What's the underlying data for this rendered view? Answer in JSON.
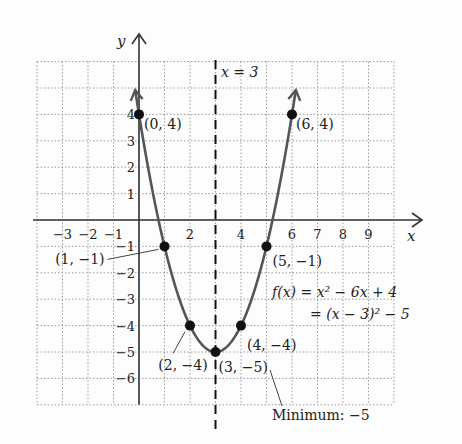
{
  "chart_data": {
    "type": "line",
    "title": "",
    "xlabel": "x",
    "ylabel": "y",
    "xlim": [
      -4,
      10
    ],
    "ylim": [
      -7,
      6
    ],
    "grid": true,
    "x_tick_labels": [
      {
        "x": -3,
        "label": "−3"
      },
      {
        "x": -2,
        "label": "−2"
      },
      {
        "x": -1,
        "label": "−1"
      },
      {
        "x": 2,
        "label": "2"
      },
      {
        "x": 4,
        "label": "4"
      },
      {
        "x": 6,
        "label": "6"
      },
      {
        "x": 7,
        "label": "7"
      },
      {
        "x": 8,
        "label": "8"
      },
      {
        "x": 9,
        "label": "9"
      }
    ],
    "y_tick_labels": [
      {
        "y": 4,
        "label": "4"
      },
      {
        "y": 3,
        "label": "3"
      },
      {
        "y": 2,
        "label": "2"
      },
      {
        "y": 1,
        "label": "1"
      },
      {
        "y": -1,
        "label": "−1"
      },
      {
        "y": -2,
        "label": "−2"
      },
      {
        "y": -3,
        "label": "−3"
      },
      {
        "y": -4,
        "label": "−4"
      },
      {
        "y": -5,
        "label": "−5"
      },
      {
        "y": -6,
        "label": "−6"
      }
    ],
    "series": [
      {
        "name": "f(x) = x^2 - 6x + 4",
        "function": "x^2 - 6x + 4",
        "domain": [
          -0.15,
          6.15
        ],
        "color": "#555555"
      }
    ],
    "points": [
      {
        "x": 0,
        "y": 4,
        "label": "(0, 4)"
      },
      {
        "x": 1,
        "y": -1,
        "label": "(1, −1)"
      },
      {
        "x": 2,
        "y": -4,
        "label": "(2, −4)"
      },
      {
        "x": 3,
        "y": -5,
        "label": "(3, −5)"
      },
      {
        "x": 4,
        "y": -4,
        "label": "(4, −4)"
      },
      {
        "x": 5,
        "y": -1,
        "label": "(5, −1)"
      },
      {
        "x": 6,
        "y": 4,
        "label": "(6, 4)"
      }
    ],
    "axis_of_symmetry": {
      "x": 3,
      "label": "x = 3"
    },
    "annotations": {
      "equation_line1": "f(x) = x² − 6x + 4",
      "equation_line2": "= (x − 3)² − 5",
      "minimum": "Minimum: −5"
    }
  }
}
